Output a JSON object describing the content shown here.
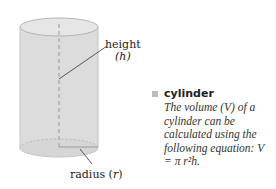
{
  "diagram": {
    "subject": "cylinder",
    "labels": {
      "height": "height",
      "height_var": "(h)",
      "radius": "radius",
      "radius_var": "r"
    },
    "colors": {
      "body_fill": "#dcdcdc",
      "top_fill": "#e6e6e6",
      "outline": "#bdbdbd",
      "dashed_line": "#9a9a9a",
      "leader_line": "#333333"
    }
  },
  "caption": {
    "title": "cylinder",
    "body": "The volume (V) of a cylinder can be calculated using the following equation: V = π r²h."
  }
}
